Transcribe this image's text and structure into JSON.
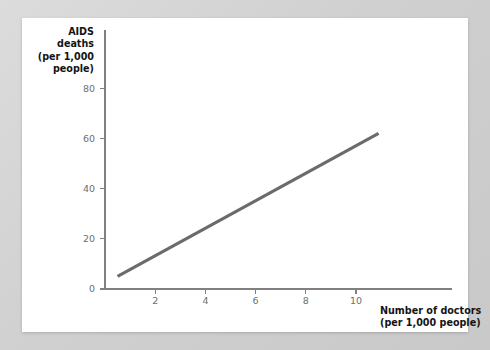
{
  "figure": {
    "background_color": "#d3d3d3",
    "card_color": "#ffffff"
  },
  "chart_data": {
    "type": "line",
    "title": "",
    "subtitle": "",
    "xlabel_lines": [
      "Number of doctors",
      "(per 1,000 people)"
    ],
    "ylabel_lines": [
      "AIDS",
      "deaths",
      "(per 1,000",
      "people)"
    ],
    "xlabel": "Number of doctors (per 1,000 people)",
    "ylabel": "AIDS deaths (per 1,000 people)",
    "xlim": [
      0,
      11.5
    ],
    "ylim": [
      0,
      88
    ],
    "xticks": [
      2,
      4,
      6,
      8,
      10
    ],
    "xtick_labels": [
      "2",
      "4",
      "6",
      "8",
      "10"
    ],
    "yticks": [
      0,
      20,
      40,
      60,
      80
    ],
    "ytick_labels": [
      "0",
      "20",
      "40",
      "60",
      "80"
    ],
    "origin_label": "0",
    "grid": false,
    "legend": false,
    "legend_position": "none",
    "series": [
      {
        "name": "AIDS deaths vs doctors",
        "color": "#6b6b6b",
        "line_width": 3.1,
        "x": [
          0.5,
          10.9
        ],
        "y": [
          5,
          62
        ]
      }
    ],
    "annotations": []
  }
}
